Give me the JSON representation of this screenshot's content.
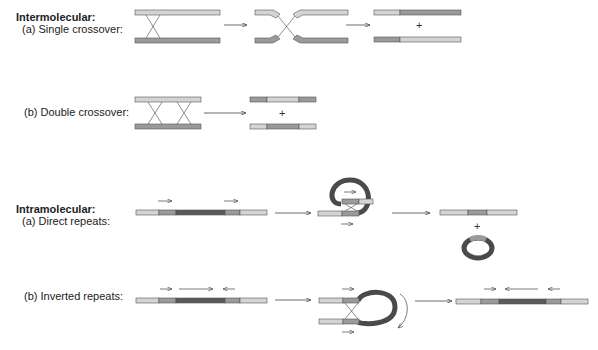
{
  "sections": {
    "intermolecular": {
      "heading": "Intermolecular:",
      "single": {
        "label": "(a) Single crossover:"
      },
      "double": {
        "label": "(b) Double crossover:"
      }
    },
    "intramolecular": {
      "heading": "Intramolecular:",
      "direct": {
        "label": "(a) Direct repeats:"
      },
      "inverted": {
        "label": "(b) Inverted repeats:"
      }
    }
  },
  "symbols": {
    "plus": "+"
  },
  "colors": {
    "light": "#d4d4d4",
    "medium": "#9a9a9a",
    "dark": "#5a5a5a",
    "darkest": "#4a4a4a",
    "outline": "#555555",
    "line": "#444444"
  }
}
